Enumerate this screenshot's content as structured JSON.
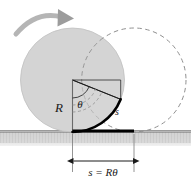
{
  "figure": {
    "labels": {
      "radius": "R",
      "angle": "θ",
      "arc": "s",
      "distance": "s = Rθ"
    },
    "colors": {
      "disk_fill": "#d4d4d4",
      "disk_stroke": "#bdbdbd",
      "dashed_stroke": "#8c8c8c",
      "ground_fill": "#c8c8c8",
      "ground_line": "#555555",
      "arc_highlight": "#000000",
      "arrow_gray": "#a8a8a8",
      "wedge_stroke": "#1a1a1a",
      "text": "#1a1a1a"
    },
    "geometry": {
      "circle_radius": 52,
      "solid_center_x": 72.5,
      "solid_center_y": 80,
      "dashed_center_x": 134,
      "dashed_center_y": 80,
      "ground_y": 132,
      "rolled_distance": 61.5,
      "theta_degrees": 68
    },
    "elements": {
      "solid_disk": "solid gray rolling disk at initial position",
      "dashed_disk": "dashed outline disk at final position",
      "wedge": "angular sector swept through angle theta",
      "contact_arc": "thick black arc on rim equal to arc length s",
      "ground_segment": "thick black ground segment of length s",
      "motion_arrow": "curved gray arrow showing rolling direction",
      "dimension_line": "double-headed dimension arrow for s = R theta"
    }
  }
}
